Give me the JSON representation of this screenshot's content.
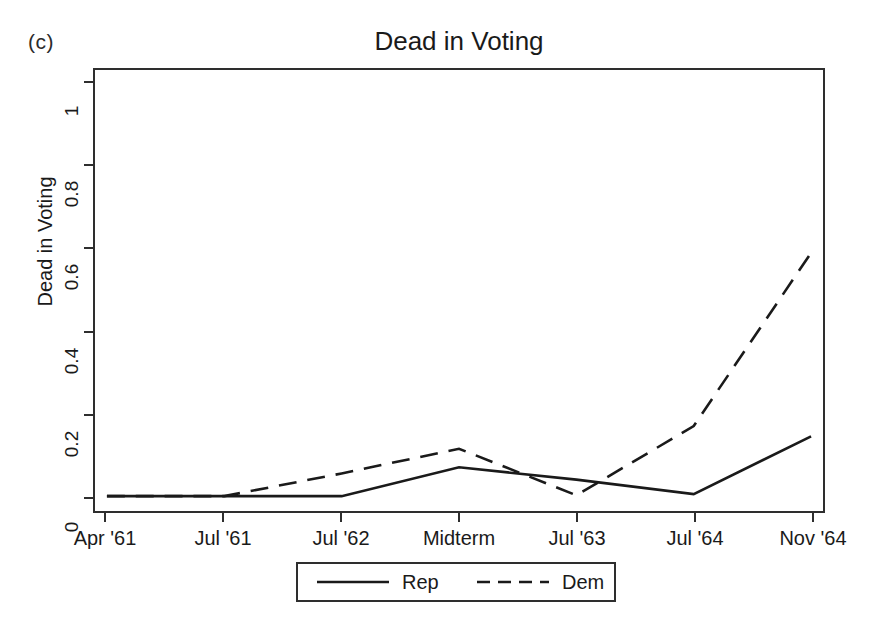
{
  "panel": {
    "label": "(c)"
  },
  "chart_data": {
    "type": "line",
    "title": "Dead in Voting",
    "xlabel": "",
    "ylabel": "Dead in Voting",
    "categories": [
      "Apr '61",
      "Jul '61",
      "Jul '62",
      "Midterm",
      "Jul '63",
      "Jul '64",
      "Nov '64"
    ],
    "ylim": [
      0,
      1
    ],
    "yticks": [
      0,
      0.2,
      0.4,
      0.6,
      0.8,
      1
    ],
    "ytick_labels": [
      "0",
      "0.2",
      "0.4",
      "0.6",
      "0.8",
      "1"
    ],
    "grid": false,
    "legend_position": "below-axes",
    "series": [
      {
        "name": "Rep",
        "style": "solid",
        "color": "#1a1a1a",
        "values": [
          0,
          0,
          0,
          0.07,
          0.04,
          0.005,
          0.145
        ]
      },
      {
        "name": "Dem",
        "style": "dashed",
        "color": "#1a1a1a",
        "values": [
          0,
          0,
          0.055,
          0.115,
          0.002,
          0.17,
          0.59
        ]
      }
    ]
  },
  "legend": {
    "entries": [
      {
        "label": "Rep",
        "style": "solid"
      },
      {
        "label": "Dem",
        "style": "dashed"
      }
    ]
  }
}
